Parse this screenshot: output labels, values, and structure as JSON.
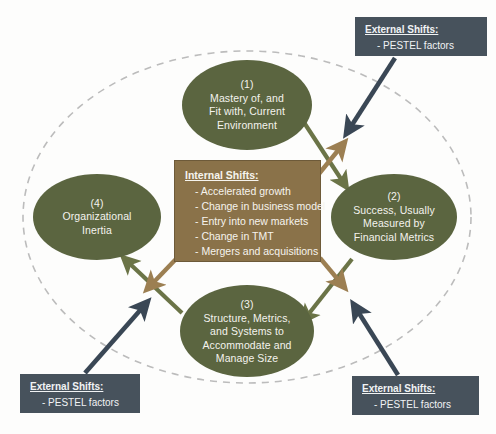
{
  "diagram": {
    "background_color": "#fdfdfc",
    "boundary": {
      "shape": "dashed-ellipse",
      "stroke_color": "#b9b9b9",
      "style": "dashed"
    },
    "colors": {
      "node_green": "#5b6540",
      "internal_box_brown": "#8a7249",
      "external_box_slate": "#47525c",
      "arrow_green": "#6b7447",
      "arrow_brown": "#9c7f52",
      "arrow_navy": "#3a4755",
      "text_light": "#f4f3ee"
    },
    "nodes": [
      {
        "id": "node-1",
        "number": "(1)",
        "lines": [
          "Mastery of, and",
          "Fit with, Current",
          "Environment"
        ]
      },
      {
        "id": "node-2",
        "number": "(2)",
        "lines": [
          "Success, Usually",
          "Measured by",
          "Financial Metrics"
        ]
      },
      {
        "id": "node-3",
        "number": "(3)",
        "lines": [
          "Structure, Metrics,",
          "and Systems to",
          "Accommodate and",
          "Manage Size"
        ]
      },
      {
        "id": "node-4",
        "number": "(4)",
        "lines": [
          "Organizational",
          "Inertia"
        ]
      }
    ],
    "internal_shifts": {
      "title": "Internal Shifts:",
      "items": [
        "- Accelerated growth",
        "- Change in business model",
        "- Entry into new markets",
        "- Change in TMT",
        "- Mergers and acquisitions"
      ]
    },
    "external_shifts": {
      "title": "External Shifts:",
      "items": [
        "- PESTEL factors"
      ],
      "instances": [
        "top-right",
        "bottom-left",
        "bottom-right"
      ]
    },
    "arrows": [
      {
        "id": "arrow-1-to-2",
        "from": "node-1",
        "to": "node-2",
        "color": "green"
      },
      {
        "id": "arrow-2-to-3",
        "from": "node-2",
        "to": "node-3",
        "color": "green"
      },
      {
        "id": "arrow-3-to-4",
        "from": "node-3",
        "to": "node-4",
        "color": "green"
      },
      {
        "id": "arrow-internal-to-1-2",
        "from": "internal-shifts",
        "to": "node-1-2-link",
        "color": "brown"
      },
      {
        "id": "arrow-internal-to-2-3",
        "from": "internal-shifts",
        "to": "node-2-3-link",
        "color": "brown"
      },
      {
        "id": "arrow-internal-to-3-4",
        "from": "internal-shifts",
        "to": "node-3-4-link",
        "color": "brown"
      },
      {
        "id": "arrow-external-tr",
        "from": "external-shifts-top-right",
        "to": "node-1-2-link",
        "color": "navy"
      },
      {
        "id": "arrow-external-br",
        "from": "external-shifts-bottom-right",
        "to": "node-2-3-link",
        "color": "navy"
      },
      {
        "id": "arrow-external-bl",
        "from": "external-shifts-bottom-left",
        "to": "node-3-4-link",
        "color": "navy"
      }
    ]
  }
}
